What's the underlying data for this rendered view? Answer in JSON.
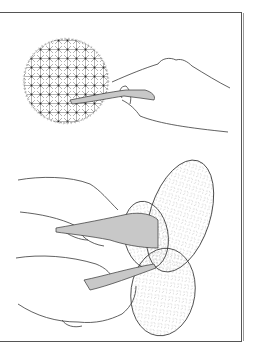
{
  "illustration": {
    "caption": "Line drawing: harvesting cactus — a knife cutting a round spiny cactus (top) and two hands cutting prickly pear pads (bottom)",
    "colors": {
      "line": "#3a3a3a",
      "knife_fill": "#c8c8c8",
      "frame": "#555555",
      "background": "#ffffff"
    },
    "panels": [
      {
        "label": "round-cactus-with-hand-and-knife"
      },
      {
        "label": "prickly-pear-pads-with-two-hands-and-knives"
      }
    ]
  }
}
